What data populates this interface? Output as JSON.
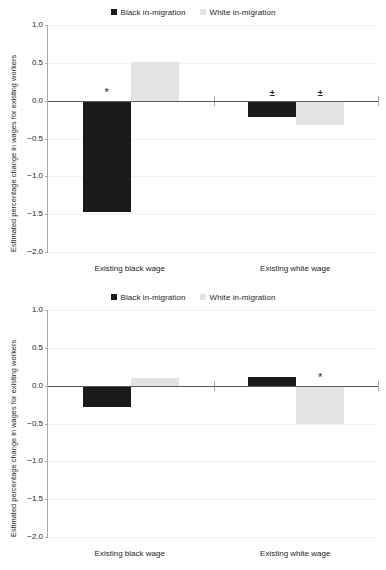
{
  "figure": {
    "title": "",
    "background": "#ffffff"
  },
  "colors": {
    "black_series": "#1a1a1a",
    "white_series": "#e2e3e4",
    "axis": "#a7a9ac",
    "zero_line": "#58595b",
    "text": "#231f20",
    "gridline": "#f2f2f2"
  },
  "legend": {
    "position": "top-center",
    "entries": [
      {
        "label": "Black in-migration",
        "color": "#1a1a1a",
        "marker": "square-marker"
      },
      {
        "label": "White in-migration",
        "color": "#e2e3e4",
        "marker": "square-marker"
      }
    ]
  },
  "axis": {
    "ylabel": "Estimated percentage change in wages for existing workers",
    "ticks": [
      "1.0",
      "0.5",
      "0.0",
      "−0.5",
      "−1.0",
      "−1.5",
      "−2.0"
    ],
    "tick_values": [
      1.0,
      0.5,
      0.0,
      -0.5,
      -1.0,
      -1.5,
      -2.0
    ],
    "ylim": [
      -2.0,
      1.0
    ],
    "categories": [
      "Existing black wage",
      "Existing white wage"
    ]
  },
  "chart_data": [
    {
      "type": "bar",
      "panel": "top",
      "title": "",
      "xlabel": "",
      "ylabel": "Estimated percentage change in wages for existing workers",
      "ylim": [
        -2.0,
        1.0
      ],
      "yticks": [
        1.0,
        0.5,
        0.0,
        -0.5,
        -1.0,
        -1.5,
        -2.0
      ],
      "ytick_labels": [
        "1.0",
        "0.5",
        "0.0",
        "−0.5",
        "−1.0",
        "−1.5",
        "−2.0"
      ],
      "grid": false,
      "legend_position": "top-center",
      "categories": [
        "Existing black wage",
        "Existing white wage"
      ],
      "series": [
        {
          "name": "Black in-migration",
          "color": "#1a1a1a",
          "values": [
            -1.47,
            -0.22
          ],
          "annotations": [
            "*",
            "±"
          ]
        },
        {
          "name": "White in-migration",
          "color": "#e2e3e4",
          "values": [
            0.51,
            -0.32
          ],
          "annotations": [
            "",
            "±"
          ]
        }
      ]
    },
    {
      "type": "bar",
      "panel": "bottom",
      "title": "",
      "xlabel": "",
      "ylabel": "Estimated percentage change in wages for existing workers",
      "ylim": [
        -2.0,
        1.0
      ],
      "yticks": [
        1.0,
        0.5,
        0.0,
        -0.5,
        -1.0,
        -1.5,
        -2.0
      ],
      "ytick_labels": [
        "1.0",
        "0.5",
        "0.0",
        "−0.5",
        "−1.0",
        "−1.5",
        "−2.0"
      ],
      "grid": false,
      "legend_position": "top-center",
      "categories": [
        "Existing black wage",
        "Existing white wage"
      ],
      "series": [
        {
          "name": "Black in-migration",
          "color": "#1a1a1a",
          "values": [
            -0.28,
            0.11
          ],
          "annotations": [
            "",
            ""
          ]
        },
        {
          "name": "White in-migration",
          "color": "#e2e3e4",
          "values": [
            0.1,
            -0.51
          ],
          "annotations": [
            "",
            "*"
          ]
        }
      ]
    }
  ]
}
